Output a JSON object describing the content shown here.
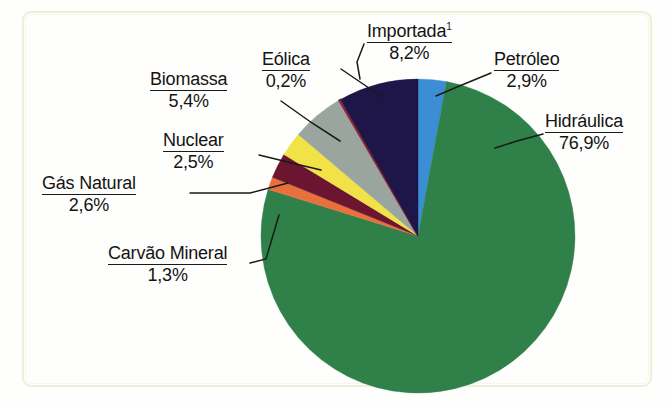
{
  "figure": {
    "kind": "pie-chart",
    "footnote_marker": "1",
    "background_color": "#fefefd",
    "frame_color": "#efeedb",
    "label_text_color": "#141414"
  },
  "chart_data": {
    "type": "pie",
    "title": "",
    "subtitle": "",
    "xlabel": "",
    "ylabel": "",
    "legend_position": "callout-labels",
    "grid": false,
    "units": "percent",
    "total": 100.0,
    "start_angle_deg": 0,
    "direction": "clockwise",
    "categories": [
      "Petróleo",
      "Hidráulica",
      "Carvão Mineral",
      "Gás Natural",
      "Nuclear",
      "Biomassa",
      "Eólica",
      "Importada"
    ],
    "values": [
      2.9,
      76.9,
      1.3,
      2.6,
      2.5,
      5.4,
      0.2,
      8.2
    ],
    "colors": [
      "#3b8dd4",
      "#2f8049",
      "#e8703c",
      "#6b1530",
      "#f0e247",
      "#9aa5a0",
      "#8b2838",
      "#1e1548"
    ],
    "slices": [
      {
        "label": "Petróleo",
        "value": 2.9,
        "value_text": "2,9%",
        "color": "#3b8dd4",
        "superscript": ""
      },
      {
        "label": "Hidráulica",
        "value": 76.9,
        "value_text": "76,9%",
        "color": "#2f8049",
        "superscript": ""
      },
      {
        "label": "Carvão Mineral",
        "value": 1.3,
        "value_text": "1,3%",
        "color": "#e8703c",
        "superscript": ""
      },
      {
        "label": "Gás Natural",
        "value": 2.6,
        "value_text": "2,6%",
        "color": "#6b1530",
        "superscript": ""
      },
      {
        "label": "Nuclear",
        "value": 2.5,
        "value_text": "2,5%",
        "color": "#f0e247",
        "superscript": ""
      },
      {
        "label": "Biomassa",
        "value": 5.4,
        "value_text": "5,4%",
        "color": "#9aa5a0",
        "superscript": ""
      },
      {
        "label": "Eólica",
        "value": 0.2,
        "value_text": "0,2%",
        "color": "#8b2838",
        "superscript": ""
      },
      {
        "label": "Importada",
        "value": 8.2,
        "value_text": "8,2%",
        "color": "#1e1548",
        "superscript": "1"
      }
    ]
  },
  "labels": {
    "biomassa": {
      "name": "Biomassa",
      "value": "5,4%"
    },
    "eolica": {
      "name": "Eólica",
      "value": "0,2%"
    },
    "importada": {
      "name": "Importada",
      "value": "8,2%",
      "sup": "1"
    },
    "petroleo": {
      "name": "Petróleo",
      "value": "2,9%"
    },
    "hidraulica": {
      "name": "Hidráulica",
      "value": "76,9%"
    },
    "nuclear": {
      "name": "Nuclear",
      "value": "2,5%"
    },
    "gas": {
      "name": "Gás Natural",
      "value": "2,6%"
    },
    "carvao": {
      "name": "Carvão Mineral",
      "value": "1,3%"
    }
  }
}
